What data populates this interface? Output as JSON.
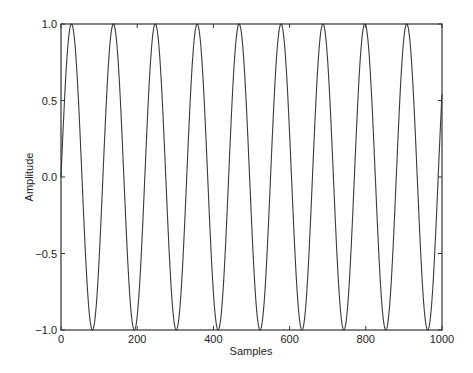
{
  "chart_data": {
    "type": "line",
    "title": "",
    "xlabel": "Samples",
    "ylabel": "Amplitude",
    "xlim": [
      0,
      1000
    ],
    "ylim": [
      -1.0,
      1.0
    ],
    "x_ticks": [
      0,
      200,
      400,
      600,
      800,
      1000
    ],
    "x_tick_labels": [
      "0",
      "200",
      "400",
      "600",
      "800",
      "1000"
    ],
    "y_ticks": [
      1.0,
      0.5,
      0.0,
      -0.5,
      -1.0
    ],
    "y_tick_labels": [
      "1.0",
      "0.5",
      "0.0",
      "−0.5",
      "−1.0"
    ],
    "grid": false,
    "legend": null,
    "series": [
      {
        "name": "sine",
        "description": "Sine wave y = sin(2*pi*n/110), n = 0..1000",
        "function": "sin",
        "amplitude": 1.0,
        "period_samples": 110,
        "phase": 0,
        "n_start": 0,
        "n_end": 1000,
        "color": "#333333",
        "peaks_x": [
          27,
          137,
          247,
          357,
          467,
          577,
          687,
          797,
          907
        ],
        "troughs_x": [
          82,
          192,
          302,
          412,
          522,
          632,
          742,
          852,
          962
        ],
        "end_value": 0.4
      }
    ]
  },
  "plot": {
    "left": 61,
    "top": 24,
    "right": 442,
    "bottom": 330,
    "frame_color": "#333333",
    "line_color": "#3a3a3a"
  }
}
